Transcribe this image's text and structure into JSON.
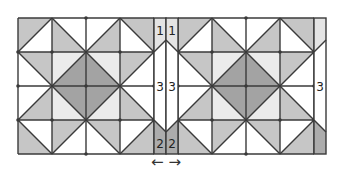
{
  "diagram": {
    "colors": {
      "line": "#3a3a3a",
      "white": "#ffffff",
      "medium": "#c6c6c6",
      "dark": "#a3a3a3",
      "very_light": "#ebebeb",
      "strip_top": "#e4e4e4",
      "strip_bottom": "#acacac",
      "text": "#222222"
    },
    "grid": {
      "top": 18,
      "cell": 34,
      "rows": 4,
      "cols": 4
    },
    "blocks": [
      {
        "name": "left-block",
        "x": 18
      },
      {
        "name": "right-block",
        "x": 178
      }
    ],
    "cell_pattern": [
      [
        {
          "diag": "anti",
          "a": "medium",
          "b": "white"
        },
        {
          "diag": "main",
          "a": "white",
          "b": "medium"
        },
        {
          "diag": "anti",
          "a": "white",
          "b": "medium"
        },
        {
          "diag": "main",
          "a": "medium",
          "b": "white"
        }
      ],
      [
        {
          "diag": "main",
          "a": "medium",
          "b": "white"
        },
        {
          "diag": "anti",
          "a": "very_light",
          "b": "dark"
        },
        {
          "diag": "main",
          "a": "very_light",
          "b": "dark"
        },
        {
          "diag": "anti",
          "a": "medium",
          "b": "white"
        }
      ],
      [
        {
          "diag": "anti",
          "a": "white",
          "b": "medium"
        },
        {
          "diag": "main",
          "a": "dark",
          "b": "very_light"
        },
        {
          "diag": "anti",
          "a": "dark",
          "b": "very_light"
        },
        {
          "diag": "main",
          "a": "white",
          "b": "medium"
        }
      ],
      [
        {
          "diag": "main",
          "a": "white",
          "b": "medium"
        },
        {
          "diag": "anti",
          "a": "medium",
          "b": "white"
        },
        {
          "diag": "main",
          "a": "medium",
          "b": "white"
        },
        {
          "diag": "anti",
          "a": "white",
          "b": "medium"
        }
      ]
    ],
    "strips": [
      {
        "name": "center-strip-left",
        "x": 154,
        "w": 12,
        "direction": "right"
      },
      {
        "name": "center-strip-right",
        "x": 166,
        "w": 12,
        "direction": "left"
      },
      {
        "name": "right-edge-strip",
        "x": 314,
        "w": 12,
        "direction": "right"
      }
    ],
    "labels": [
      {
        "name": "label-1-left",
        "text": "1",
        "x": 160,
        "y": 35
      },
      {
        "name": "label-1-right",
        "text": "1",
        "x": 172,
        "y": 35
      },
      {
        "name": "label-3-left",
        "text": "3",
        "x": 160,
        "y": 91
      },
      {
        "name": "label-3-right",
        "text": "3",
        "x": 172,
        "y": 91
      },
      {
        "name": "label-2-left",
        "text": "2",
        "x": 160,
        "y": 148
      },
      {
        "name": "label-2-right",
        "text": "2",
        "x": 172,
        "y": 148
      },
      {
        "name": "label-3-edge",
        "text": "3",
        "x": 320,
        "y": 91
      }
    ],
    "arrows": {
      "text": "← →",
      "x": 166,
      "y": 167
    }
  }
}
